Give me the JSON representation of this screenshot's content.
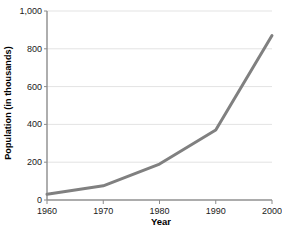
{
  "chart_data": {
    "type": "line",
    "title": "",
    "xlabel": "Year",
    "ylabel": "Population (in thousands)",
    "x": [
      1960,
      1970,
      1980,
      1990,
      2000
    ],
    "categories": [
      "1960",
      "1970",
      "1980",
      "1990",
      "2000"
    ],
    "values": [
      30,
      75,
      190,
      370,
      870
    ],
    "series": [
      {
        "name": "Population",
        "values": [
          30,
          75,
          190,
          370,
          870
        ]
      }
    ],
    "xlim": [
      1960,
      2000
    ],
    "ylim": [
      0,
      1000
    ],
    "ytick_labels": [
      "0",
      "200",
      "400",
      "600",
      "800",
      "1,000"
    ],
    "ytick_values": [
      0,
      200,
      400,
      600,
      800,
      1000
    ],
    "xtick_labels": [
      "1960",
      "1970",
      "1980",
      "1990",
      "2000"
    ],
    "xtick_values": [
      1960,
      1970,
      1980,
      1990,
      2000
    ],
    "grid": true,
    "grid_axis": "y",
    "legend": false,
    "legend_position": "none",
    "line_color": "#808080",
    "grid_color": "#e3e3e3",
    "axis_color": "#9a9a9a",
    "background_color": "#ffffff"
  }
}
